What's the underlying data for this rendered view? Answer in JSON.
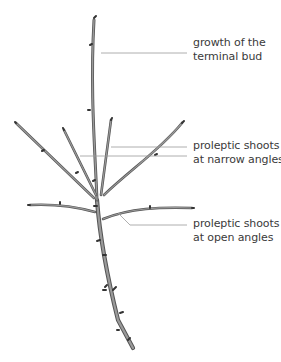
{
  "diagram": {
    "colors": {
      "stroke": "#3c3c3c",
      "fill": "#8a8a8a",
      "leader": "#9a9a9a",
      "text": "#3a3a3a"
    },
    "labels": [
      {
        "id": "terminal",
        "line1": "growth of the",
        "line2": "terminal bud"
      },
      {
        "id": "narrow",
        "line1": "proleptic shoots",
        "line2": "at narrow angles"
      },
      {
        "id": "open",
        "line1": "proleptic shoots",
        "line2": "at open angles"
      }
    ]
  }
}
